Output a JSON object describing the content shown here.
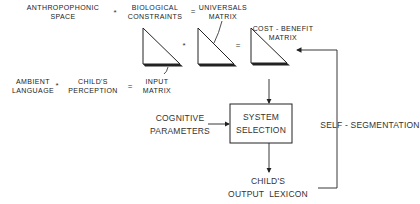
{
  "top_equation": {
    "term1": [
      "ANTHROPOPHONIC",
      "SPACE"
    ],
    "op1": "*",
    "term2": [
      "BIOLOGICAL",
      "CONSTRAINTS"
    ],
    "op2": "=",
    "result": [
      "UNIVERSALS",
      "MATRIX"
    ]
  },
  "matrix_equation": {
    "op1": "*",
    "op2": "=",
    "result_label": [
      "COST - BENEFIT",
      "MATRIX"
    ]
  },
  "input_equation": {
    "term1": [
      "AMBIENT",
      "LANGUAGE"
    ],
    "op1": "*",
    "term2": [
      "CHILD'S",
      "PERCEPTION"
    ],
    "op2": "=",
    "result": [
      "INPUT",
      "MATRIX"
    ]
  },
  "process": {
    "cognitive": [
      "COGNITIVE",
      "PARAMETERS"
    ],
    "box": [
      "SYSTEM",
      "SELECTION"
    ],
    "output": [
      "CHILD'S",
      "OUTPUT  LEXICON"
    ],
    "feedback": "SELF - SEGMENTATION"
  }
}
